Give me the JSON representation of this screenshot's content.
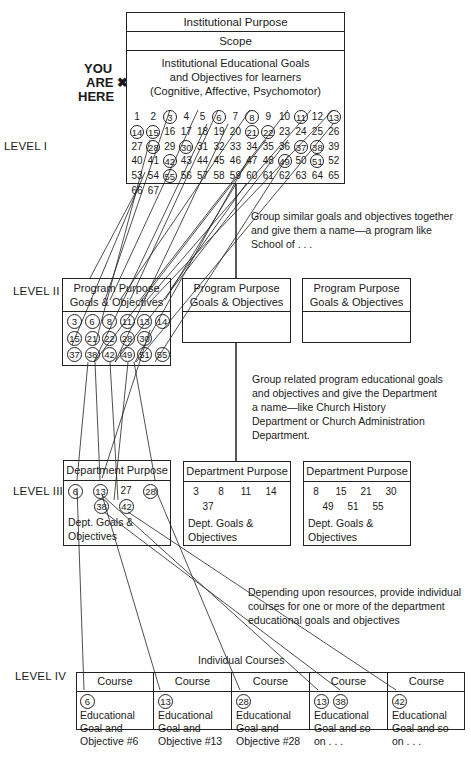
{
  "you_are_here": {
    "line1": "YOU",
    "line2": "ARE",
    "line3": "HERE",
    "marker": "✖"
  },
  "levels": {
    "l1": "LEVEL I",
    "l2": "LEVEL II",
    "l3": "LEVEL III",
    "l4": "LEVEL IV"
  },
  "level1": {
    "purpose": "Institutional Purpose",
    "scope": "Scope",
    "goals_line1": "Institutional Educational Goals",
    "goals_line2": "and Objectives for learners",
    "goals_line3": "(Cognitive, Affective, Psychomotor)",
    "numbers_range": [
      1,
      67
    ],
    "circled": [
      3,
      6,
      8,
      11,
      13,
      14,
      15,
      21,
      22,
      28,
      30,
      37,
      38,
      42,
      49,
      51,
      55
    ]
  },
  "notes": {
    "n1_l1": "Group similar goals and objectives together",
    "n1_l2": "and give them a name—a program like",
    "n1_l3": "School of . . .",
    "n2_l1": "Group related program educational goals",
    "n2_l2": "and objectives and give the Department",
    "n2_l3": "a name—like Church History",
    "n2_l4": "Department or Church Administration",
    "n2_l5": "Department.",
    "n3_l1": "Depending upon resources, provide individual",
    "n3_l2": "courses for one or more of the department",
    "n3_l3": "educational goals and objectives"
  },
  "level2": {
    "programs": [
      {
        "line1": "Program Purpose",
        "line2": "Goals & Objectives",
        "rows": [
          [
            "3",
            "6",
            "8",
            "11",
            "13",
            "14"
          ],
          [
            "15",
            "21",
            "22",
            "28",
            "30"
          ],
          [
            "37",
            "38",
            "42",
            "49",
            "51",
            "55"
          ]
        ]
      },
      {
        "line1": "Program Purpose",
        "line2": "Goals & Objectives",
        "rows": []
      },
      {
        "line1": "Program Purpose",
        "line2": "Goals & Objectives",
        "rows": []
      }
    ]
  },
  "level3": {
    "departments": [
      {
        "title": "Department Purpose",
        "row1": [
          "6",
          "13",
          "27",
          "28"
        ],
        "row2": [
          "38",
          "42"
        ],
        "circled": [
          "6",
          "13",
          "28",
          "38",
          "42"
        ],
        "goals1": "Dept. Goals &",
        "goals2": "Objectives"
      },
      {
        "title": "Department Purpose",
        "row1": [
          "3",
          "8",
          "11",
          "14"
        ],
        "row2": [
          "37"
        ],
        "circled": [],
        "goals1": "Dept. Goals &",
        "goals2": "Objectives"
      },
      {
        "title": "Department Purpose",
        "row1": [
          "8",
          "15",
          "21",
          "30"
        ],
        "row2": [
          "49",
          "51",
          "55"
        ],
        "circled": [],
        "goals1": "Dept. Goals &",
        "goals2": "Objectives"
      }
    ]
  },
  "level4": {
    "caption": "Individual Courses",
    "courses": [
      {
        "title": "Course",
        "tags": [
          "6"
        ],
        "l1": "Educational",
        "l2": "Goal and",
        "l3": "Objective #6"
      },
      {
        "title": "Course",
        "tags": [
          "13"
        ],
        "l1": "Educational",
        "l2": "Goal and",
        "l3": "Objective #13"
      },
      {
        "title": "Course",
        "tags": [
          "28"
        ],
        "l1": "Educational",
        "l2": "Goal and",
        "l3": "Objective #28"
      },
      {
        "title": "Course",
        "tags": [
          "13",
          "38"
        ],
        "l1": "Educational",
        "l2": "Goal and so",
        "l3": "on . . ."
      },
      {
        "title": "Course",
        "tags": [
          "42"
        ],
        "l1": "Educational",
        "l2": "Goal and so",
        "l3": "on . . ."
      }
    ]
  }
}
